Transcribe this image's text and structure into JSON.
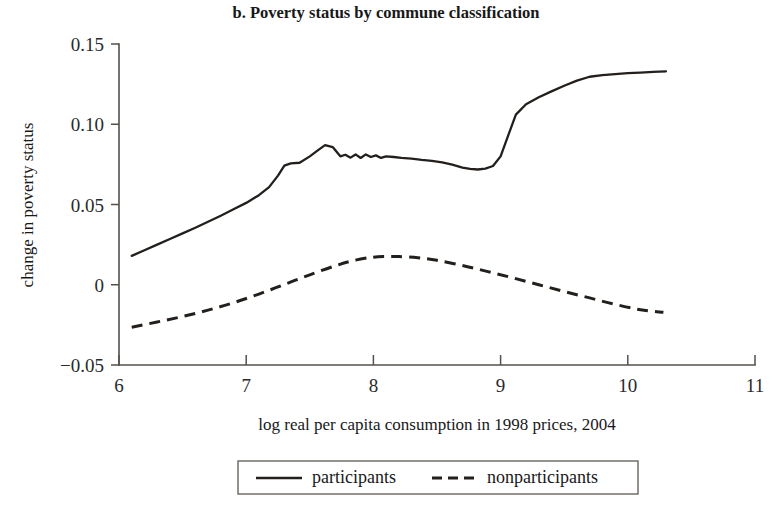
{
  "chart_data": {
    "type": "line",
    "title": "b. Poverty status by commune classification",
    "xlabel": "log real per capita consumption in 1998 prices, 2004",
    "ylabel": "change in poverty status",
    "xlim": [
      6,
      11
    ],
    "ylim": [
      -0.05,
      0.15
    ],
    "xticks": [
      6,
      7,
      8,
      9,
      10,
      11
    ],
    "xtick_labels": [
      "6",
      "7",
      "8",
      "9",
      "10",
      "11"
    ],
    "yticks": [
      -0.05,
      0,
      0.05,
      0.1,
      0.15
    ],
    "ytick_labels": [
      "−0.05",
      "0",
      "0.05",
      "0.10",
      "0.15"
    ],
    "grid": false,
    "legend_position": "below-center",
    "series": [
      {
        "name": "participants",
        "style": "solid",
        "color": "#231f1c",
        "x": [
          6.1,
          6.2,
          6.3,
          6.4,
          6.5,
          6.6,
          6.7,
          6.8,
          6.9,
          7.0,
          7.1,
          7.18,
          7.25,
          7.3,
          7.35,
          7.42,
          7.5,
          7.56,
          7.62,
          7.68,
          7.74,
          7.78,
          7.82,
          7.86,
          7.9,
          7.94,
          7.98,
          8.02,
          8.06,
          8.1,
          8.16,
          8.22,
          8.3,
          8.38,
          8.46,
          8.54,
          8.62,
          8.7,
          8.76,
          8.82,
          8.88,
          8.94,
          9.0,
          9.06,
          9.12,
          9.2,
          9.3,
          9.4,
          9.5,
          9.6,
          9.7,
          9.8,
          9.9,
          10.0,
          10.1,
          10.2,
          10.3
        ],
        "y": [
          0.018,
          0.0215,
          0.025,
          0.0285,
          0.032,
          0.0355,
          0.0392,
          0.043,
          0.047,
          0.051,
          0.0558,
          0.0608,
          0.068,
          0.0742,
          0.0756,
          0.076,
          0.08,
          0.0836,
          0.087,
          0.0858,
          0.08,
          0.081,
          0.0792,
          0.0812,
          0.079,
          0.0812,
          0.0796,
          0.0806,
          0.079,
          0.08,
          0.0796,
          0.079,
          0.0786,
          0.0778,
          0.0772,
          0.0762,
          0.0748,
          0.073,
          0.0722,
          0.0718,
          0.0724,
          0.074,
          0.08,
          0.093,
          0.106,
          0.1125,
          0.1168,
          0.1205,
          0.124,
          0.1272,
          0.1296,
          0.1306,
          0.1312,
          0.1318,
          0.1322,
          0.1326,
          0.133
        ]
      },
      {
        "name": "nonparticipants",
        "style": "dashed",
        "color": "#231f1c",
        "x": [
          6.1,
          6.3,
          6.5,
          6.7,
          6.9,
          7.1,
          7.3,
          7.5,
          7.7,
          7.85,
          8.0,
          8.1,
          8.2,
          8.35,
          8.5,
          8.7,
          8.9,
          9.1,
          9.3,
          9.5,
          9.7,
          9.9,
          10.1,
          10.28
        ],
        "y": [
          -0.0265,
          -0.0232,
          -0.0198,
          -0.0158,
          -0.0112,
          -0.0058,
          0.0002,
          0.0062,
          0.0118,
          0.0152,
          0.0172,
          0.0176,
          0.0176,
          0.0168,
          0.0152,
          0.012,
          0.0082,
          0.0042,
          0.0,
          -0.0042,
          -0.0082,
          -0.0122,
          -0.0156,
          -0.0172
        ]
      }
    ]
  },
  "legend": {
    "items": [
      {
        "label": "participants",
        "style": "solid"
      },
      {
        "label": "nonparticipants",
        "style": "dashed"
      }
    ]
  }
}
